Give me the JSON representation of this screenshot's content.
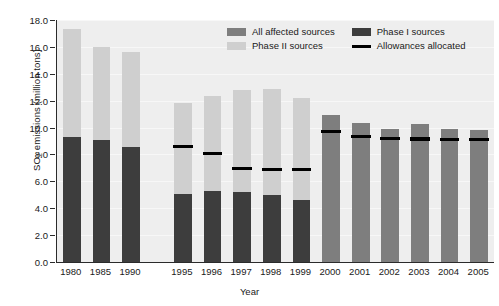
{
  "chart_data": {
    "type": "bar",
    "title": "",
    "xlabel": "Year",
    "ylabel": "SO2 emissions (million tons)",
    "ylabel_rich": {
      "prefix": "SO",
      "sub": "2",
      "suffix": " emissions (million tons)"
    },
    "ylim": [
      0.0,
      18.0
    ],
    "ytick_step": 2.0,
    "ytick_labels": [
      "18.0",
      "16.0",
      "14.0",
      "12.0",
      "10.0",
      "8.0",
      "6.0",
      "4.0",
      "2.0",
      "0.0"
    ],
    "ytick_values": [
      18.0,
      16.0,
      14.0,
      12.0,
      10.0,
      8.0,
      6.0,
      4.0,
      2.0,
      0.0
    ],
    "grid": true,
    "legend_position": "top-center",
    "categories": [
      "1980",
      "1985",
      "1990",
      "1995",
      "1996",
      "1997",
      "1998",
      "1999",
      "2000",
      "2001",
      "2002",
      "2003",
      "2004",
      "2005"
    ],
    "series": [
      {
        "name": "Phase I sources",
        "color": "#3d3d3d",
        "values": [
          9.3,
          9.05,
          8.55,
          5.05,
          5.25,
          5.2,
          5.0,
          4.6,
          null,
          null,
          null,
          null,
          null,
          null
        ]
      },
      {
        "name": "Phase II sources",
        "color": "#cfcfcf",
        "note": "stacked on top of Phase I; values are the stacked totals",
        "values": [
          17.35,
          16.0,
          15.65,
          11.8,
          12.35,
          12.8,
          12.85,
          12.2,
          null,
          null,
          null,
          null,
          null,
          null
        ]
      },
      {
        "name": "All affected sources",
        "color": "#7e7e7e",
        "values": [
          null,
          null,
          null,
          null,
          null,
          null,
          null,
          null,
          10.9,
          10.35,
          9.9,
          10.3,
          9.9,
          9.8
        ]
      },
      {
        "name": "Allowances allocated",
        "color": "#000000",
        "type": "marker-line",
        "values": [
          null,
          null,
          null,
          8.6,
          8.1,
          6.95,
          6.85,
          6.85,
          9.7,
          9.35,
          9.2,
          9.15,
          9.1,
          9.1
        ]
      }
    ],
    "legend": [
      {
        "label": "All affected sources",
        "swatch": "all-affected"
      },
      {
        "label": "Phase I sources",
        "swatch": "phase-1"
      },
      {
        "label": "Phase II sources",
        "swatch": "phase-2"
      },
      {
        "label": "Allowances allocated",
        "swatch": "allowance-line"
      }
    ]
  },
  "colors": {
    "plot_background": "#eeeeee",
    "gridline": "#f7f7f7",
    "axis": "#2b2b2b",
    "phase1": "#3d3d3d",
    "phase2": "#cfcfcf",
    "all_affected": "#7e7e7e",
    "allowance": "#000000",
    "text": "#1a1a1a"
  }
}
